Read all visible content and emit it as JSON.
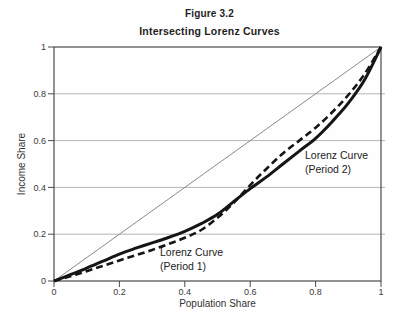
{
  "figure": {
    "number": "Figure 3.2",
    "title": "Intersecting Lorenz Curves"
  },
  "chart_data": {
    "type": "line",
    "figure_number": "Figure 3.2",
    "title": "Intersecting Lorenz Curves",
    "xlabel": "Population Share",
    "ylabel": "Income Share",
    "xlim": [
      0,
      1
    ],
    "ylim": [
      0,
      1
    ],
    "xticks": [
      0,
      0.2,
      0.4,
      0.6,
      0.8,
      1
    ],
    "yticks": [
      0,
      0.2,
      0.4,
      0.6,
      0.8,
      1
    ],
    "grid": "horizontal-only",
    "legend": "none",
    "x": [
      0,
      0.05,
      0.1,
      0.15,
      0.2,
      0.25,
      0.3,
      0.35,
      0.4,
      0.45,
      0.5,
      0.55,
      0.6,
      0.65,
      0.7,
      0.75,
      0.8,
      0.85,
      0.9,
      0.95,
      1
    ],
    "series": [
      {
        "name": "Line of Equality",
        "role": "reference-diagonal",
        "line_style": "solid",
        "stroke_width": 1,
        "color": "#8a8a8a",
        "x": [
          0,
          1
        ],
        "y": [
          0,
          1
        ]
      },
      {
        "name": "Lorenz Curve (Period 1)",
        "line_style": "dashed",
        "stroke_width": 2.6,
        "color": "#151515",
        "y": [
          0,
          0.02,
          0.042,
          0.065,
          0.088,
          0.11,
          0.133,
          0.158,
          0.185,
          0.218,
          0.27,
          0.335,
          0.41,
          0.48,
          0.545,
          0.6,
          0.655,
          0.72,
          0.795,
          0.885,
          1
        ]
      },
      {
        "name": "Lorenz Curve (Period 2)",
        "line_style": "solid",
        "stroke_width": 3,
        "color": "#151515",
        "y": [
          0,
          0.027,
          0.055,
          0.085,
          0.115,
          0.14,
          0.163,
          0.186,
          0.212,
          0.245,
          0.285,
          0.34,
          0.395,
          0.445,
          0.5,
          0.555,
          0.61,
          0.68,
          0.76,
          0.86,
          1
        ]
      }
    ],
    "annotations": [
      {
        "text": "Lorenz Curve\n(Period 1)",
        "x": 0.325,
        "y": 0.15
      },
      {
        "text": "Lorenz Curve\n(Period 2)",
        "x": 0.768,
        "y": 0.564
      }
    ]
  },
  "colors": {
    "curve": "#151515",
    "equality_line": "#8a8a8a",
    "gridline": "#b5b5b5",
    "frame": "#4a4a4a",
    "text": "#1e1e1e"
  }
}
